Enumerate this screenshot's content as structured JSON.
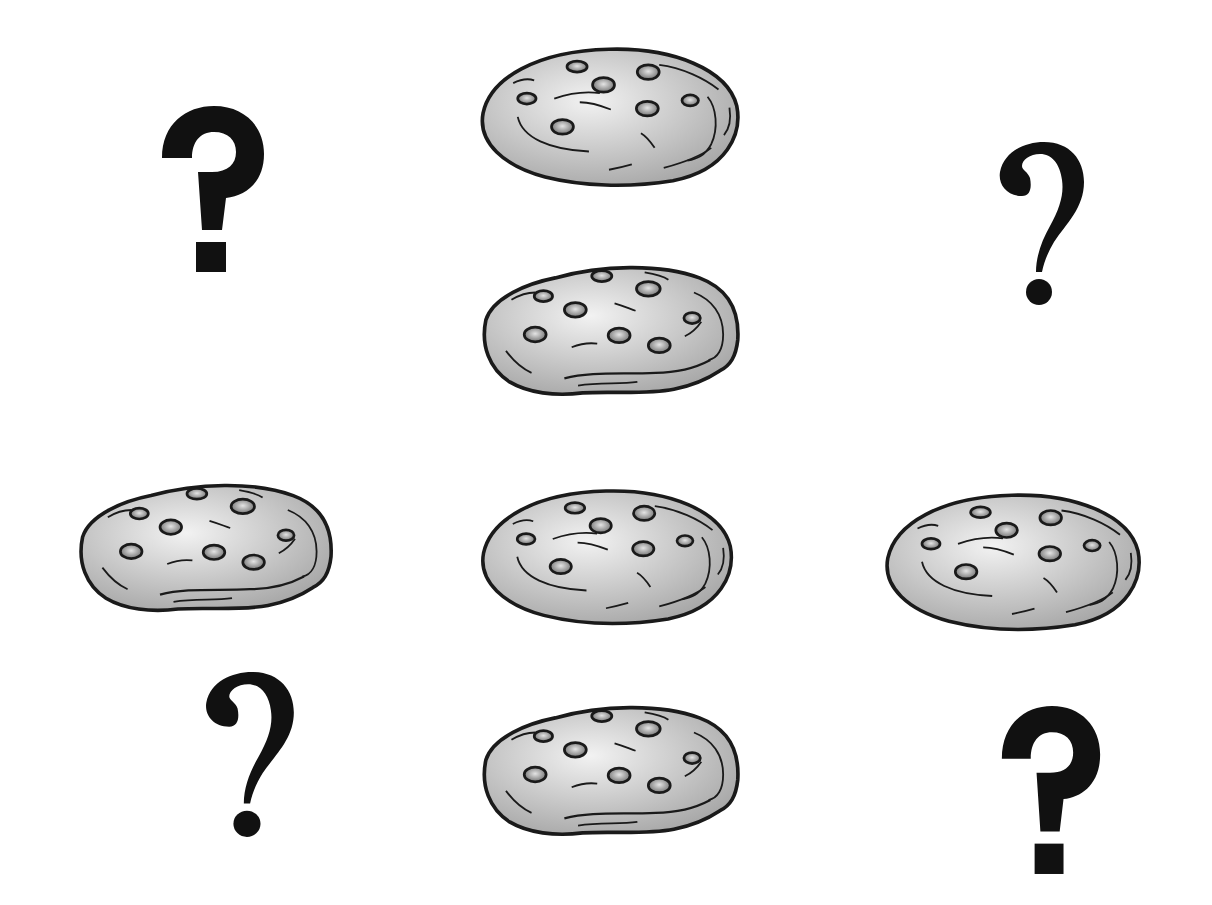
{
  "scene": {
    "background": "#ffffff",
    "description": "Pattern puzzle of chocolate chip cookies and question marks"
  },
  "colors": {
    "cookie_fill_light": "#e6e6e6",
    "cookie_fill_dark": "#a9a9a9",
    "outline": "#1a1a1a",
    "chip_light": "#d9d9d9",
    "chip_dark": "#6b6b6b",
    "qmark": "#111111"
  },
  "cookies": [
    {
      "id": "cookie-top",
      "variant": "smooth",
      "chips": 7,
      "x": 468,
      "y": 42,
      "w": 282,
      "h": 146
    },
    {
      "id": "cookie-second",
      "variant": "lumpy",
      "chips": 8,
      "x": 470,
      "y": 256,
      "w": 280,
      "h": 146
    },
    {
      "id": "cookie-row3-left",
      "variant": "lumpy",
      "chips": 8,
      "x": 66,
      "y": 474,
      "w": 278,
      "h": 144
    },
    {
      "id": "cookie-row3-center",
      "variant": "smooth",
      "chips": 7,
      "x": 466,
      "y": 484,
      "w": 280,
      "h": 142
    },
    {
      "id": "cookie-row3-right",
      "variant": "smooth",
      "chips": 7,
      "x": 872,
      "y": 488,
      "w": 280,
      "h": 144
    },
    {
      "id": "cookie-bottom",
      "variant": "lumpy",
      "chips": 8,
      "x": 470,
      "y": 696,
      "w": 280,
      "h": 146
    }
  ],
  "question_marks": [
    {
      "id": "qmark-top-left",
      "glyph": "?",
      "style": "sans",
      "x": 158,
      "y": 102,
      "w": 110,
      "h": 172
    },
    {
      "id": "qmark-top-right",
      "glyph": "?",
      "style": "serif",
      "x": 992,
      "y": 138,
      "w": 96,
      "h": 170
    },
    {
      "id": "qmark-bottom-left",
      "glyph": "?",
      "style": "serif",
      "x": 198,
      "y": 668,
      "w": 100,
      "h": 172
    },
    {
      "id": "qmark-bottom-right",
      "glyph": "?",
      "style": "sans",
      "x": 998,
      "y": 702,
      "w": 106,
      "h": 174
    }
  ]
}
